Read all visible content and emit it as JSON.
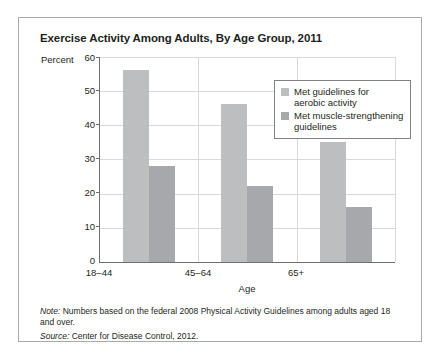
{
  "chart_data": {
    "type": "bar",
    "title": "Exercise Activity Among Adults, By Age Group, 2011",
    "categories": [
      "18–44",
      "45–64",
      "65+"
    ],
    "series": [
      {
        "name": "Met guidelines for\naerobic activity",
        "values": [
          56,
          46,
          35
        ]
      },
      {
        "name": "Met muscle-strengthening\nguidelines",
        "values": [
          28,
          22,
          16
        ]
      }
    ],
    "xlabel": "Age",
    "ylabel": "Percent",
    "ylim": [
      0,
      60
    ],
    "yticks": [
      "0",
      "10",
      "20",
      "30",
      "40",
      "50",
      "60"
    ],
    "grid": true,
    "legend_position": "top-right",
    "colors": {
      "aerobic": "#bcbec0",
      "muscle": "#a6a8ab",
      "gridline": "#d9d9d9",
      "axis": "#6d6e71",
      "border": "#a7a9ac",
      "text": "#231f20"
    }
  },
  "footnotes": {
    "note_label": "Note:",
    "note_text": " Numbers based on the federal 2008 Physical Activity Guidelines among adults aged 18 and over.",
    "source_label": "Source:",
    "source_text": " Center for Disease Control, 2012."
  }
}
